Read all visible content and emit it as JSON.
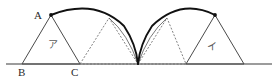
{
  "figure": {
    "kind": "geometry-diagram",
    "background_color": "#ffffff",
    "line_color": "#3a3a3a",
    "arc_color": "#1a1a1a",
    "dashed_color": "#6b6b6b",
    "label_color": "#2a2a2a",
    "region_label_color": "#5a5a5a",
    "canvas": {
      "width": 278,
      "height": 81
    },
    "baseline": {
      "name": "ground-line",
      "y": 64,
      "x_start": 6,
      "x_end": 272
    },
    "vertex_labels": [
      {
        "id": "A",
        "text": "A",
        "x": 34,
        "y": 10
      },
      {
        "id": "B",
        "text": "B",
        "x": 18,
        "y": 67
      },
      {
        "id": "C",
        "text": "C",
        "x": 71,
        "y": 67
      }
    ],
    "region_labels": [
      {
        "id": "a",
        "text": "ア",
        "x": 48,
        "y": 40
      },
      {
        "id": "i",
        "text": "イ",
        "x": 207,
        "y": 42
      }
    ],
    "points": {
      "B": {
        "x": 22,
        "y": 64
      },
      "C": {
        "x": 80,
        "y": 64
      },
      "A": {
        "x": 51,
        "y": 15
      },
      "cusp": {
        "x": 138,
        "y": 64
      },
      "D": {
        "x": 109,
        "y": 18
      },
      "E": {
        "x": 167,
        "y": 18
      },
      "F": {
        "x": 186,
        "y": 64
      },
      "G": {
        "x": 215,
        "y": 15
      },
      "H": {
        "x": 244,
        "y": 64
      }
    },
    "triangles": [
      {
        "id": "t1",
        "style": "solid",
        "pts": "22,64 51,15 80,64"
      },
      {
        "id": "t2",
        "style": "dashed",
        "pts": "80,64 109,18 138,64"
      },
      {
        "id": "t3",
        "style": "dashed",
        "pts": "138,64 167,18 186,64"
      },
      {
        "id": "t4",
        "style": "solid",
        "pts": "186,64 215,15 244,64"
      }
    ],
    "arcs": [
      {
        "id": "arc-left-main",
        "style": "thick",
        "d": "M 51,15 Q 95,-2 124,26 Q 136,44 138,64"
      },
      {
        "id": "arc-left-inner",
        "style": "thin",
        "d": "M 109,18 Q 128,34 138,64"
      },
      {
        "id": "arc-right-main",
        "style": "thick",
        "d": "M 138,64 Q 140,44 152,26 Q 181,-2 215,15"
      },
      {
        "id": "arc-right-inner",
        "style": "thin",
        "d": "M 138,64 Q 148,34 167,18"
      }
    ],
    "marked_points": [
      {
        "id": "A-dot",
        "x": 51,
        "y": 15
      },
      {
        "id": "G-dot",
        "x": 215,
        "y": 15
      }
    ]
  }
}
